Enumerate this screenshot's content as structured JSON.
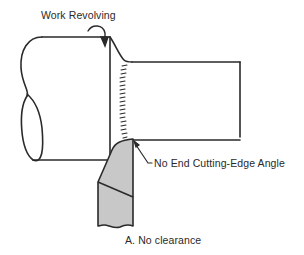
{
  "diagram": {
    "labels": {
      "work_revolving": "Work Revolving",
      "end_cutting_edge": "No End Cutting-Edge Angle",
      "caption": "A.  No clearance"
    },
    "colors": {
      "line": "#2a2a2a",
      "tool_fill": "#c8c8c8",
      "background": "#ffffff"
    },
    "parts": [
      "workpiece-large-diameter",
      "workpiece-small-diameter",
      "cut-shoulder-hatching",
      "cutting-tool",
      "rotation-arrow",
      "leader-line"
    ]
  }
}
